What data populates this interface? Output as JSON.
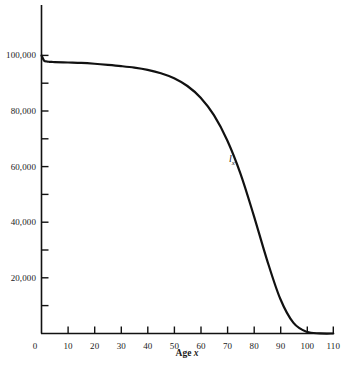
{
  "chart_data": {
    "type": "line",
    "title": "",
    "subtitle": "",
    "xlabel_text": "Age ",
    "xlabel_var": "x",
    "ylabel": "",
    "xlim": [
      0,
      110
    ],
    "ylim": [
      0,
      110000
    ],
    "grid": false,
    "legend": "none",
    "annotations": [
      {
        "name": "series-label",
        "base": "l",
        "sub": "x",
        "x": 71,
        "y": 57000
      }
    ],
    "x_ticks": [
      0,
      10,
      20,
      30,
      40,
      50,
      60,
      70,
      80,
      90,
      100,
      110
    ],
    "x_tick_labels": [
      "0",
      "10",
      "20",
      "30",
      "40",
      "50",
      "60",
      "70",
      "80",
      "90",
      "100",
      "110"
    ],
    "y_ticks": [
      0,
      10000,
      20000,
      30000,
      40000,
      50000,
      60000,
      70000,
      80000,
      90000,
      100000
    ],
    "y_major_ticks": [
      20000,
      40000,
      60000,
      80000,
      100000
    ],
    "y_tick_labels": [
      "20,000",
      "40,000",
      "60,000",
      "80,000",
      "100,000"
    ],
    "series": [
      {
        "name": "l_x",
        "color": "#111111",
        "x": [
          0,
          1,
          2,
          3,
          4,
          5,
          10,
          15,
          20,
          25,
          30,
          35,
          40,
          45,
          50,
          55,
          60,
          65,
          70,
          75,
          80,
          85,
          90,
          95,
          100,
          105,
          110
        ],
        "values": [
          100000,
          98100,
          97800,
          97700,
          97650,
          97600,
          97450,
          97300,
          97000,
          96600,
          96150,
          95600,
          94800,
          93600,
          91800,
          89000,
          84800,
          78500,
          69500,
          57500,
          42500,
          26500,
          12500,
          3800,
          600,
          40,
          0
        ]
      }
    ]
  },
  "colors": {
    "axis": "#111111",
    "curve": "#111111",
    "background": "#ffffff"
  }
}
